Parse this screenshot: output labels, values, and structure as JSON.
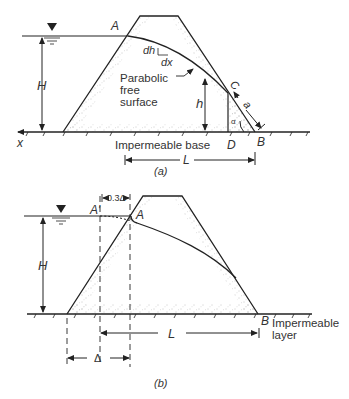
{
  "figure_a": {
    "caption": "(a)",
    "labels": {
      "A": "A",
      "H": "H",
      "h": "h",
      "dh": "dh",
      "dx": "dx",
      "parabolic_1": "Parabolic",
      "parabolic_2": "free",
      "parabolic_3": "surface",
      "C": "C",
      "a": "a",
      "alpha": "α",
      "D": "D",
      "B": "B",
      "x": "x",
      "base": "Impermeable base",
      "L": "L"
    }
  },
  "figure_b": {
    "caption": "(b)",
    "labels": {
      "A_prime": "A′",
      "A": "A",
      "H": "H",
      "offset": "0.3Δ",
      "B": "B",
      "layer_1": "Impermeable",
      "layer_2": "layer",
      "L": "L",
      "delta": "Δ"
    }
  },
  "colors": {
    "line": "#222222",
    "text": "#333333",
    "stipple": "#777777"
  }
}
